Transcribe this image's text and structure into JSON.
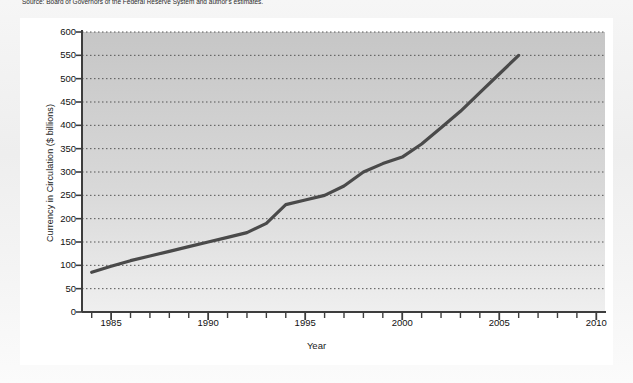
{
  "caption": "Source: Board of Governors of the Federal Reserve System and author's estimates.",
  "figure": {
    "background_color": "#ffffff",
    "plot_fill_top": "#c9c9c9",
    "plot_fill_bottom": "#ededed",
    "line_color": "#4a4a4a",
    "axis_color": "#3d3d3d",
    "grid_color": "#555555"
  },
  "chart_data": {
    "type": "line",
    "title": "",
    "xlabel": "Year",
    "ylabel": "Currency in Circulation ($ billions)",
    "xlim": [
      1983.5,
      2010.5
    ],
    "ylim": [
      0,
      600
    ],
    "xticks": [
      1985,
      1990,
      1995,
      2000,
      2005,
      2010
    ],
    "xtick_labels": [
      "1985",
      "1990",
      "1995",
      "2000",
      "2005",
      "2010"
    ],
    "xminor_tick_step": 1,
    "yticks": [
      0,
      50,
      100,
      150,
      200,
      250,
      300,
      350,
      400,
      450,
      500,
      550,
      600
    ],
    "ytick_labels": [
      "0",
      "50",
      "100",
      "150",
      "200",
      "250",
      "300",
      "350",
      "400",
      "450",
      "500",
      "550",
      "600"
    ],
    "grid": "horizontal-dotted",
    "legend": "none",
    "series": [
      {
        "name": "Currency in Circulation",
        "x": [
          1984,
          1985,
          1986,
          1987,
          1988,
          1989,
          1990,
          1991,
          1992,
          1993,
          1994,
          1995,
          1996,
          1997,
          1998,
          1999,
          2000,
          2001,
          2002,
          2003,
          2004,
          2005,
          2006
        ],
        "values": [
          85,
          98,
          110,
          120,
          130,
          140,
          150,
          160,
          170,
          190,
          230,
          240,
          250,
          270,
          300,
          318,
          332,
          360,
          395,
          430,
          470,
          510,
          550
        ]
      }
    ]
  }
}
